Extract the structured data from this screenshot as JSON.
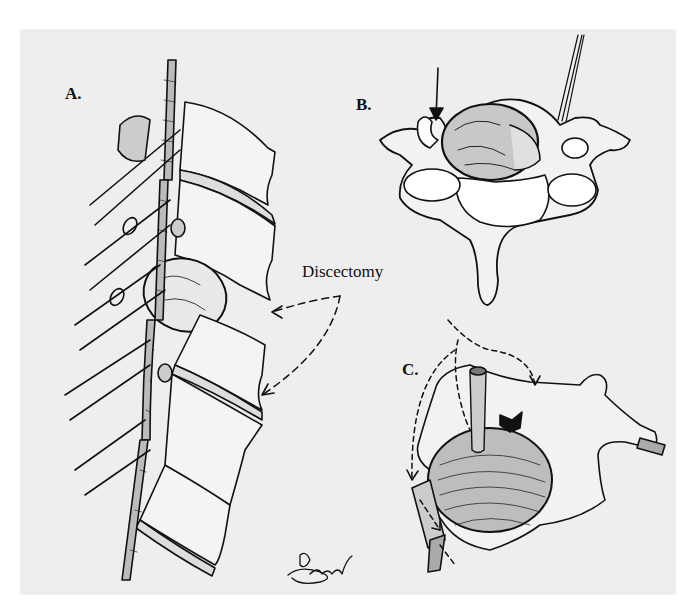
{
  "figure": {
    "panels": [
      {
        "id": "A",
        "label": "A.",
        "depicts": "lateral view of spine with nerve root and herniated disc"
      },
      {
        "id": "B",
        "label": "B.",
        "depicts": "axial view of vertebra with herniated disc and instrument"
      },
      {
        "id": "C",
        "label": "C.",
        "depicts": "oblique view of vertebra with nerve root and directional arrows"
      }
    ],
    "callout": {
      "text": "Discectomy"
    },
    "signature": {
      "present": true
    }
  },
  "colors": {
    "background": "#eeeeee",
    "ink": "#111111",
    "page": "#ffffff"
  }
}
